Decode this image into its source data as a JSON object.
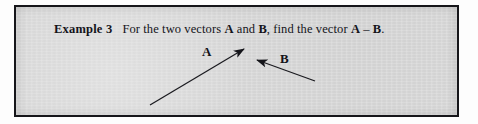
{
  "document": {
    "type": "textbook-example-figure",
    "background_color": "#d8d8d8",
    "border_color": "#16161a",
    "ink_color": "#14141a"
  },
  "statement": {
    "lead": "Example 3",
    "part1": "For the two vectors",
    "vector_a": "A",
    "conjunction": "and",
    "vector_b": "B",
    "part2": ", find the vector",
    "vector_a2": "A",
    "minus": "–",
    "vector_b2": "B",
    "period": ".",
    "full_text": "Example 3  For the two vectors A and B, find the vector A – B."
  },
  "figure": {
    "labels": {
      "a": "A",
      "b": "B"
    },
    "vectors": [
      {
        "name": "A",
        "label": "A",
        "tail": {
          "x": 148,
          "y": 103
        },
        "head": {
          "x": 244,
          "y": 46
        },
        "label_position": {
          "x": 205,
          "y": 50
        }
      },
      {
        "name": "B",
        "label": "B",
        "tail": {
          "x": 313,
          "y": 79
        },
        "head": {
          "x": 252,
          "y": 57
        },
        "label_position": {
          "x": 283,
          "y": 57
        }
      }
    ]
  }
}
